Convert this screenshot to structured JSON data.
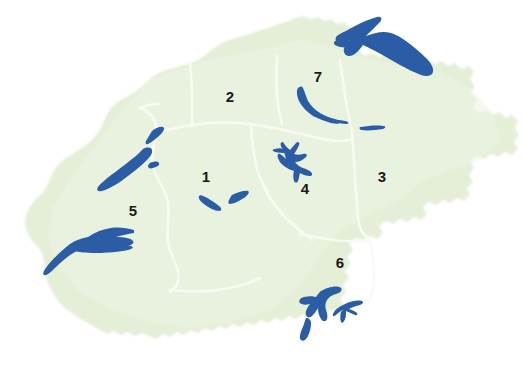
{
  "map": {
    "title": "Switzerland regions map",
    "colors": {
      "background": "#ffffff",
      "land": "#e5efd7",
      "land_edge": "#eef4e6",
      "water": "#2a5da6",
      "water_dark": "#234f91",
      "border_line": "#f7fbf2",
      "label_text": "#1a1a1a"
    },
    "regions": [
      {
        "id": "region-1",
        "label": "1",
        "x": 206,
        "y": 178
      },
      {
        "id": "region-2",
        "label": "2",
        "x": 230,
        "y": 98
      },
      {
        "id": "region-3",
        "label": "3",
        "x": 382,
        "y": 178
      },
      {
        "id": "region-4",
        "label": "4",
        "x": 305,
        "y": 190
      },
      {
        "id": "region-5",
        "label": "5",
        "x": 133,
        "y": 212
      },
      {
        "id": "region-6",
        "label": "6",
        "x": 340,
        "y": 264
      },
      {
        "id": "region-7",
        "label": "7",
        "x": 318,
        "y": 78
      }
    ],
    "lakes": [
      {
        "id": "lake-constance",
        "name": "lake-constance"
      },
      {
        "id": "lake-zurich",
        "name": "lake-zurich"
      },
      {
        "id": "lake-walen",
        "name": "lake-walen"
      },
      {
        "id": "lake-lucerne",
        "name": "lake-lucerne"
      },
      {
        "id": "lake-neuchatel",
        "name": "lake-neuchatel"
      },
      {
        "id": "lake-biel",
        "name": "lake-biel"
      },
      {
        "id": "lake-murten",
        "name": "lake-murten"
      },
      {
        "id": "lake-geneva",
        "name": "lake-geneva"
      },
      {
        "id": "lake-thun",
        "name": "lake-thun"
      },
      {
        "id": "lake-brienz",
        "name": "lake-brienz"
      },
      {
        "id": "lake-maggiore",
        "name": "lake-maggiore"
      },
      {
        "id": "lake-lugano",
        "name": "lake-lugano"
      }
    ]
  }
}
